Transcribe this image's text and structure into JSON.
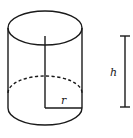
{
  "diagram": {
    "type": "cylinder",
    "labels": {
      "radius": "r",
      "height": "h"
    },
    "colors": {
      "line": "#1a1a1a",
      "background": "#ffffff"
    }
  }
}
